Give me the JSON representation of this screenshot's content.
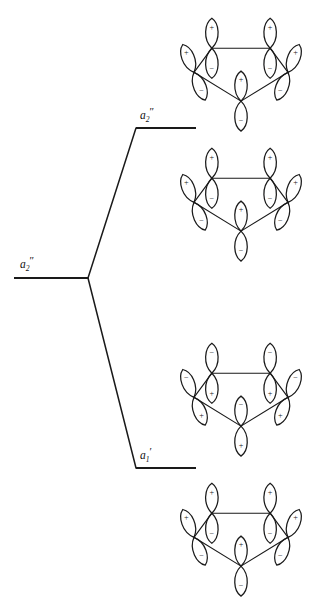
{
  "figure": {
    "kind": "molecular-orbital-correlation-diagram",
    "ring_size": 5,
    "orbital_type": "p-orbital",
    "background": "#ffffff",
    "ink": "#1a1a1a"
  },
  "levels": [
    {
      "id": "center",
      "label_base": "a",
      "label_sub": "2",
      "label_prime": "″",
      "label_text": "a2″",
      "x1": 14,
      "x2": 88,
      "y": 278,
      "label_x": 20,
      "label_y": 268
    },
    {
      "id": "upper",
      "label_base": "a",
      "label_sub": "2",
      "label_prime": "″",
      "label_text": "a2″",
      "x1": 136,
      "x2": 196,
      "y": 128,
      "label_x": 140,
      "label_y": 119
    },
    {
      "id": "lower",
      "label_base": "a",
      "label_sub": "1",
      "label_prime": "′",
      "label_text": "a1′",
      "x1": 136,
      "x2": 196,
      "y": 468,
      "label_x": 140,
      "label_y": 459
    }
  ],
  "connectors": [
    {
      "id": "center-to-upper",
      "x1": 88,
      "y1": 278,
      "x2": 136,
      "y2": 128
    },
    {
      "id": "center-to-lower",
      "x1": 88,
      "y1": 278,
      "x2": 136,
      "y2": 468
    }
  ],
  "signs": {
    "positive": "+",
    "negative": "−"
  },
  "ring_diagrams": [
    {
      "id": "ring-1",
      "linked_level": "upper",
      "cx": 241,
      "cy": 68,
      "rx": 47,
      "ry": 36,
      "top_sign": "+",
      "bottom_sign": "−",
      "vertices": [
        {
          "name": "top-left",
          "sign_up": "+",
          "sign_down": "−",
          "tilt": 0
        },
        {
          "name": "top-right",
          "sign_up": "+",
          "sign_down": "−",
          "tilt": 0
        },
        {
          "name": "right",
          "sign_up": "+",
          "sign_down": "−",
          "tilt": 22
        },
        {
          "name": "bottom",
          "sign_up": "+",
          "sign_down": "−",
          "tilt": 0
        },
        {
          "name": "left",
          "sign_up": "+",
          "sign_down": "−",
          "tilt": -22
        }
      ]
    },
    {
      "id": "ring-2",
      "linked_level": "upper",
      "cx": 241,
      "cy": 198,
      "rx": 47,
      "ry": 36,
      "top_sign": "+",
      "bottom_sign": "−",
      "vertices": [
        {
          "name": "top-left",
          "sign_up": "+",
          "sign_down": "−",
          "tilt": 0
        },
        {
          "name": "top-right",
          "sign_up": "+",
          "sign_down": "−",
          "tilt": 0
        },
        {
          "name": "right",
          "sign_up": "+",
          "sign_down": "−",
          "tilt": 22
        },
        {
          "name": "bottom",
          "sign_up": "+",
          "sign_down": "−",
          "tilt": 0
        },
        {
          "name": "left",
          "sign_up": "+",
          "sign_down": "−",
          "tilt": -22
        }
      ]
    },
    {
      "id": "ring-3",
      "linked_level": "lower",
      "cx": 241,
      "cy": 393,
      "rx": 47,
      "ry": 36,
      "top_sign": "−",
      "bottom_sign": "+",
      "vertices": [
        {
          "name": "top-left",
          "sign_up": "−",
          "sign_down": "+",
          "tilt": 0
        },
        {
          "name": "top-right",
          "sign_up": "−",
          "sign_down": "+",
          "tilt": 0
        },
        {
          "name": "right",
          "sign_up": "−",
          "sign_down": "+",
          "tilt": 22
        },
        {
          "name": "bottom",
          "sign_up": "−",
          "sign_down": "+",
          "tilt": 0
        },
        {
          "name": "left",
          "sign_up": "−",
          "sign_down": "+",
          "tilt": -22
        }
      ]
    },
    {
      "id": "ring-4",
      "linked_level": "lower",
      "cx": 241,
      "cy": 533,
      "rx": 47,
      "ry": 36,
      "top_sign": "+",
      "bottom_sign": "−",
      "vertices": [
        {
          "name": "top-left",
          "sign_up": "+",
          "sign_down": "−",
          "tilt": 0
        },
        {
          "name": "top-right",
          "sign_up": "+",
          "sign_down": "−",
          "tilt": 0
        },
        {
          "name": "right",
          "sign_up": "+",
          "sign_down": "−",
          "tilt": 22
        },
        {
          "name": "bottom",
          "sign_up": "+",
          "sign_down": "−",
          "tilt": 0
        },
        {
          "name": "left",
          "sign_up": "+",
          "sign_down": "−",
          "tilt": -22
        }
      ]
    }
  ]
}
